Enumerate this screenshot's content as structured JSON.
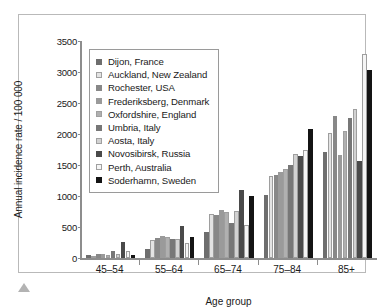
{
  "figure": {
    "marker_icon": "triangle-up-icon"
  },
  "chart_data": {
    "type": "bar",
    "title": "",
    "xlabel": "Age group",
    "ylabel": "Annual incidence rate / 100 000",
    "categories": [
      "45–54",
      "55–64",
      "65–74",
      "75–84",
      "85+"
    ],
    "ylim": [
      0,
      3500
    ],
    "yticks": [
      0,
      500,
      1000,
      1500,
      2000,
      2500,
      3000,
      3500
    ],
    "grid": false,
    "legend_position": "upper-left-inside",
    "series": [
      {
        "name": "Dijon, France",
        "color": "#6e6e6e",
        "values": [
          45,
          140,
          420,
          1020,
          1710
        ]
      },
      {
        "name": "Auckland, New Zealand",
        "color": "#e3e3e3",
        "values": [
          40,
          295,
          715,
          1325,
          2020
        ]
      },
      {
        "name": "Rochester, USA",
        "color": "#888888",
        "values": [
          70,
          330,
          700,
          1345,
          2285
        ]
      },
      {
        "name": "Frederiksberg, Denmark",
        "color": "#9a9a9a",
        "values": [
          60,
          360,
          770,
          1380,
          1655
        ]
      },
      {
        "name": "Oxfordshire, England",
        "color": "#b0b0b0",
        "values": [
          55,
          340,
          745,
          1430,
          2045
        ]
      },
      {
        "name": "Umbria, Italy",
        "color": "#777777",
        "values": [
          120,
          305,
          565,
          1500,
          2265
        ]
      },
      {
        "name": "Aosta, Italy",
        "color": "#d2d2d2",
        "values": [
          70,
          310,
          760,
          1680,
          2400
        ]
      },
      {
        "name": "Novosibirsk, Russia",
        "color": "#4a4a4a",
        "values": [
          265,
          510,
          1095,
          1645,
          1570
        ]
      },
      {
        "name": "Perth, Australia",
        "color": "#f5f5f5",
        "values": [
          110,
          250,
          535,
          1750,
          3290
        ]
      },
      {
        "name": "Soderhamn, Sweden",
        "color": "#141414",
        "values": [
          55,
          335,
          1000,
          2085,
          3040
        ]
      }
    ]
  }
}
